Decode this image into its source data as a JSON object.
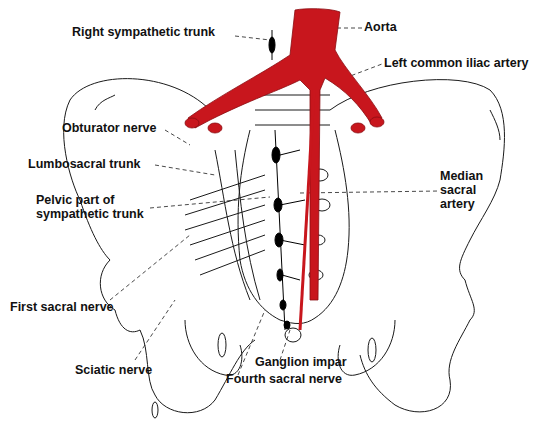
{
  "figure": {
    "colors": {
      "artery": "#c8161d",
      "line": "#1a1a1a",
      "ganglion": "#000000",
      "background": "#ffffff"
    }
  },
  "labels": {
    "right_sympathetic_trunk": "Right sympathetic trunk",
    "aorta": "Aorta",
    "left_common_iliac_artery": "Left common iliac artery",
    "obturator_nerve": "Obturator nerve",
    "lumbosacral_trunk": "Lumbosacral trunk",
    "pelvic_part_line1": "Pelvic part of",
    "pelvic_part_line2": "sympathetic trunk",
    "median_sacral_line1": "Median",
    "median_sacral_line2": "sacral",
    "median_sacral_line3": "artery",
    "first_sacral_nerve": "First sacral nerve",
    "sciatic_nerve": "Sciatic nerve",
    "ganglion_impar": "Ganglion impar",
    "fourth_sacral_nerve": "Fourth sacral nerve"
  }
}
